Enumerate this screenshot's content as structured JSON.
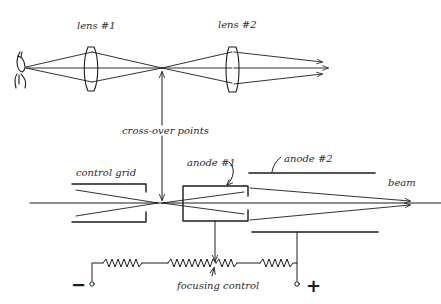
{
  "diagram": {
    "colors": {
      "ink": "#1c1c1c",
      "background": "#ffffff"
    },
    "optical_system": {
      "labels": {
        "lens1": "lens #1",
        "lens2": "lens #2"
      },
      "elements": [
        "eye-icon",
        "lens-1",
        "crossover-point",
        "lens-2",
        "ray-arrows"
      ]
    },
    "shared_label": {
      "crossover": "cross-over points"
    },
    "electron_gun": {
      "labels": {
        "control_grid": "control grid",
        "anode1": "anode #1",
        "anode2": "anode #2",
        "beam": "beam"
      }
    },
    "circuit": {
      "labels": {
        "focusing_control": "focusing control",
        "negative": "−",
        "positive": "+"
      },
      "resistors": 4
    }
  }
}
